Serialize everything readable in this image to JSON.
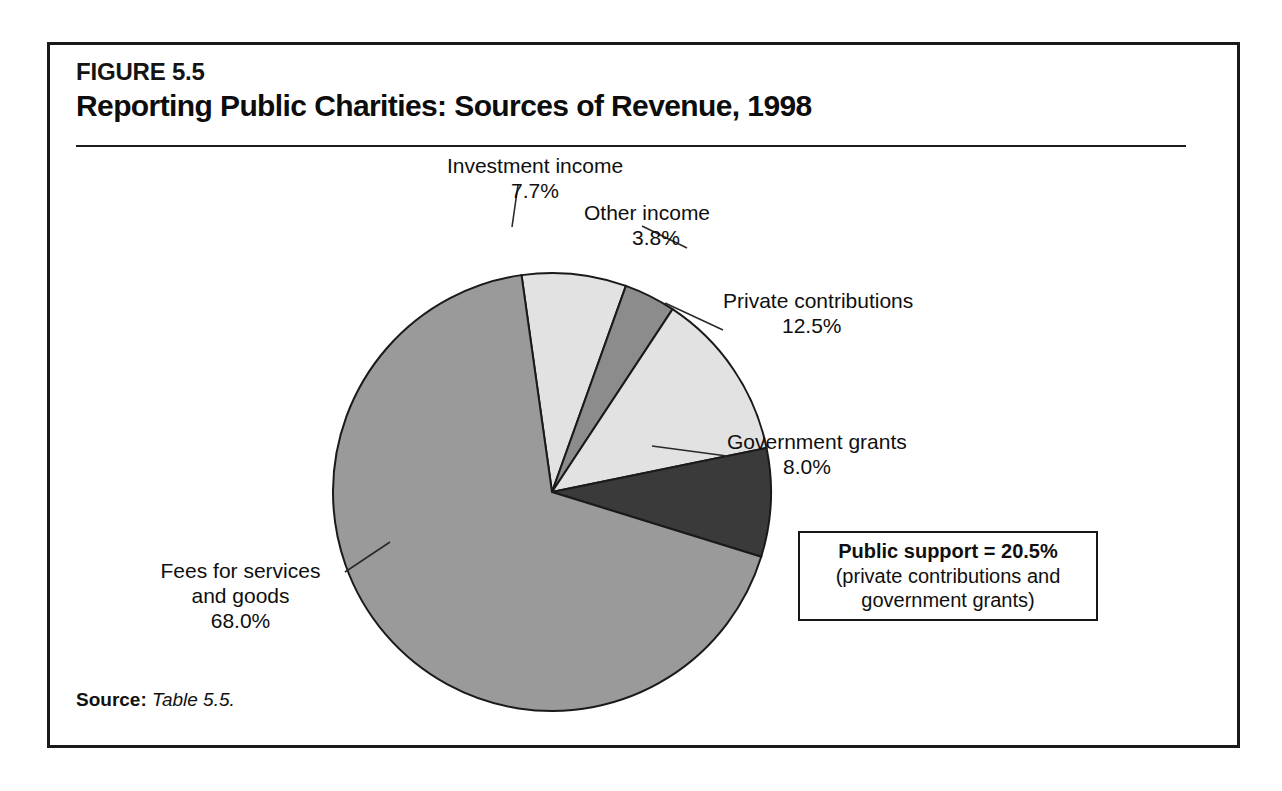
{
  "figure": {
    "number": "FIGURE 5.5",
    "title": "Reporting Public Charities: Sources of Revenue, 1998",
    "source_label": "Source:",
    "source_value": "Table 5.5."
  },
  "callout": {
    "line1": "Public support = 20.5%",
    "line2": "(private contributions and",
    "line3": "government grants)"
  },
  "labels": {
    "investment": {
      "name": "Investment income",
      "value": "7.7%"
    },
    "other": {
      "name": "Other income",
      "value": "3.8%"
    },
    "private": {
      "name": "Private contributions",
      "value": "12.5%"
    },
    "government": {
      "name": "Government grants",
      "value": "8.0%"
    },
    "fees": {
      "name_line1": "Fees for services",
      "name_line2": "and goods",
      "value": "68.0%"
    }
  },
  "colors": {
    "slice_light": "#e2e2e2",
    "slice_medium": "#9a9a9a",
    "slice_medium_dark": "#8c8c8c",
    "slice_dark": "#3a3a3a",
    "outline": "#1a1a1a",
    "frame": "#1a1a1a",
    "text": "#0f0f0f"
  },
  "chart_data": {
    "type": "pie",
    "title": "Reporting Public Charities: Sources of Revenue, 1998",
    "unit": "percent",
    "total": 100.0,
    "start_angle_deg": -8,
    "direction": "clockwise",
    "categories": [
      "Investment income",
      "Other income",
      "Private contributions",
      "Government grants",
      "Fees for services and goods"
    ],
    "values": [
      7.7,
      3.8,
      12.5,
      8.0,
      68.0
    ],
    "slices": [
      {
        "label": "Investment income",
        "value": 7.7,
        "value_text": "7.7%",
        "color": "#e2e2e2"
      },
      {
        "label": "Other income",
        "value": 3.8,
        "value_text": "3.8%",
        "color": "#8c8c8c"
      },
      {
        "label": "Private contributions",
        "value": 12.5,
        "value_text": "12.5%",
        "color": "#e2e2e2"
      },
      {
        "label": "Government grants",
        "value": 8.0,
        "value_text": "8.0%",
        "color": "#3a3a3a"
      },
      {
        "label": "Fees for services and goods",
        "value": 68.0,
        "value_text": "68.0%",
        "color": "#9a9a9a"
      }
    ],
    "annotations": [
      "Public support = 20.5% (private contributions and government grants)"
    ],
    "legend": "none",
    "grid": false,
    "geometry": {
      "cx": 502,
      "cy": 447,
      "r": 219
    }
  }
}
